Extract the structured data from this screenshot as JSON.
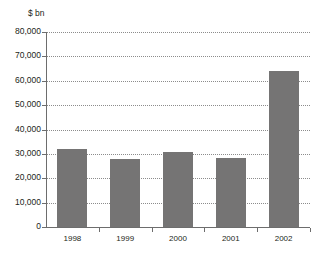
{
  "chart_data": {
    "type": "bar",
    "title": "",
    "subtitle": "",
    "unit_label": "$ bn",
    "xlabel": "",
    "ylabel": "$ bn",
    "categories": [
      "1998",
      "1999",
      "2000",
      "2001",
      "2002"
    ],
    "values": [
      32000,
      28000,
      30800,
      28200,
      64000
    ],
    "series": [
      {
        "name": "",
        "values": [
          32000,
          28000,
          30800,
          28200,
          64000
        ]
      }
    ],
    "ylim": [
      0,
      80000
    ],
    "y_ticks": [
      0,
      10000,
      20000,
      30000,
      40000,
      50000,
      60000,
      70000,
      80000
    ],
    "y_tick_labels": [
      "0",
      "10,000",
      "20,000",
      "30,000",
      "40,000",
      "50,000",
      "60,000",
      "70,000",
      "80,000"
    ],
    "grid": true,
    "grid_orientation": "horizontal",
    "grid_style": "dotted",
    "legend": false,
    "legend_position": "none",
    "bar_color": "#757474",
    "axis_color": "#6d6d6d",
    "grid_color": "#8c8c8c",
    "text_color": "#231f20",
    "background_color": "#ffffff"
  }
}
